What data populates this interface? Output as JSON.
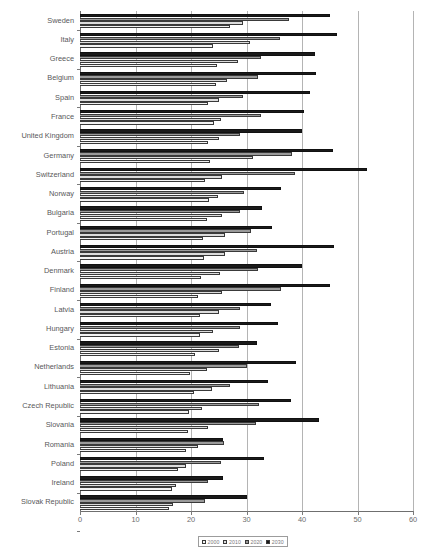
{
  "chart_data": {
    "type": "bar",
    "orientation": "horizontal",
    "title": "",
    "xlabel": "",
    "ylabel": "",
    "xlim": [
      0,
      60
    ],
    "xticks": [
      0,
      10,
      20,
      30,
      40,
      50,
      60
    ],
    "grid": true,
    "legend_position": "bottom-center",
    "series_order_top_to_bottom": [
      "2030",
      "2020",
      "2010",
      "2000"
    ],
    "legend": [
      {
        "label": "2000",
        "color": "#f3f3f3"
      },
      {
        "label": "2010",
        "color": "#dcdcdc"
      },
      {
        "label": "2020",
        "color": "#9a9a9a"
      },
      {
        "label": "2030",
        "color": "#1a1a1a"
      }
    ],
    "categories": [
      "Sweden",
      "Italy",
      "Greece",
      "Belgium",
      "Spain",
      "France",
      "United Kingdom",
      "Germany",
      "Switzerland",
      "Norway",
      "Bulgaria",
      "Portugal",
      "Austria",
      "Denmark",
      "Finland",
      "Latvia",
      "Hungary",
      "Estonia",
      "Netherlands",
      "Lithuania",
      "Czech Republic",
      "Slovania",
      "Romania",
      "Poland",
      "Ireland",
      "Slovak Republic"
    ],
    "series": [
      {
        "name": "2000",
        "values": [
          27.1,
          24.0,
          24.6,
          24.5,
          23.1,
          24.2,
          23.1,
          23.4,
          22.5,
          23.2,
          22.9,
          22.1,
          22.4,
          21.8,
          21.3,
          21.6,
          21.7,
          20.8,
          19.8,
          20.5,
          19.7,
          19.5,
          19.1,
          17.6,
          16.6,
          16.1
        ]
      },
      {
        "name": "2010",
        "values": [
          29.3,
          30.7,
          28.5,
          26.4,
          25.1,
          25.4,
          25.0,
          31.1,
          25.6,
          24.8,
          25.6,
          26.1,
          26.1,
          25.2,
          25.5,
          25.1,
          24.0,
          25.1,
          22.8,
          23.7,
          21.9,
          23.0,
          21.3,
          19.1,
          17.3,
          16.8
        ]
      },
      {
        "name": "2020",
        "values": [
          37.7,
          36.0,
          32.6,
          32.1,
          29.4,
          32.6,
          28.8,
          38.2,
          38.7,
          29.6,
          28.8,
          30.8,
          31.9,
          32.0,
          36.3,
          28.8,
          28.8,
          28.6,
          30.1,
          27.0,
          32.2,
          31.8,
          26.0,
          25.4,
          23.1,
          22.6
        ]
      },
      {
        "name": "2030",
        "values": [
          45.1,
          46.3,
          42.3,
          42.6,
          41.5,
          40.3,
          40.0,
          45.5,
          51.8,
          36.2,
          32.8,
          34.6,
          45.8,
          40.0,
          45.0,
          34.4,
          35.6,
          31.9,
          39.0,
          33.9,
          38.0,
          43.0,
          25.8,
          33.2,
          25.8,
          30.0
        ]
      }
    ]
  }
}
